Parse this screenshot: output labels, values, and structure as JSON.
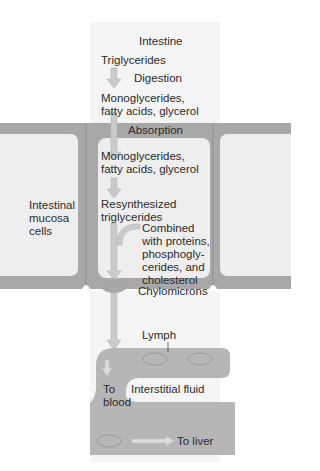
{
  "diagram": {
    "title": "Intestine",
    "steps": {
      "triglycerides": "Triglycerides",
      "digestion": "Digestion",
      "monoglycerides_1_line1": "Monoglycerides,",
      "monoglycerides_1_line2": "fatty acids, glycerol",
      "absorption": "Absorption",
      "monoglycerides_2_line1": "Monoglycerides,",
      "monoglycerides_2_line2": "fatty acids, glycerol",
      "resynthesized_line1": "Resynthesized",
      "resynthesized_line2": "triglycerides",
      "combined_lines": [
        "Combined",
        "with proteins,",
        "phosphogly-",
        "cerides, and",
        "cholesterol"
      ],
      "chylomicrons": "Chylomicrons"
    },
    "side_label_lines": [
      "Intestinal",
      "mucosa",
      "cells"
    ],
    "lymph": "Lymph",
    "interstitial_fluid": "Interstitial fluid",
    "to_blood_lines": [
      "To",
      "blood"
    ],
    "to_liver": "To liver",
    "colors": {
      "cell_wall": "#a9a9a9",
      "cell_interior": "#efefef",
      "lumen": "#f6f6f6",
      "arrow": "#c8c8c8",
      "vessel": "#b3b3b3",
      "vessel_dark": "#9d9d9d"
    }
  }
}
